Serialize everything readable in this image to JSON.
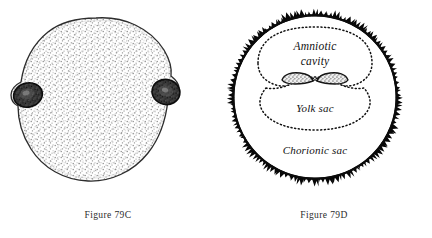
{
  "page": {
    "background_color": "#ffffff",
    "ink_color": "#111111",
    "width": 432,
    "height": 238
  },
  "figures": [
    {
      "id": "79C",
      "caption": "Figure 79C",
      "subject": "chorionic-vesicle-external-view",
      "description": "Stippled rounded chorionic vesicle with two dark villous patches at left and right margins",
      "labels": [],
      "features": [
        {
          "name": "stippled-surface",
          "shade": "#9a9a9a"
        },
        {
          "name": "villous-patch-left",
          "shade": "#2a2a2a"
        },
        {
          "name": "villous-patch-right",
          "shade": "#2a2a2a"
        }
      ]
    },
    {
      "id": "79D",
      "caption": "Figure 79D",
      "subject": "chorionic-sac-sagittal-section",
      "description": "Circular chorionic sac outlined by dark villi, containing amniotic cavity, embryonic disc and yolk sac",
      "labels": [
        {
          "name": "amniotic-cavity",
          "line1": "Amniotic",
          "line2": "cavity"
        },
        {
          "name": "yolk-sac",
          "text": "Yolk sac"
        },
        {
          "name": "chorionic-sac",
          "text": "Chorionic sac"
        }
      ],
      "features": [
        {
          "name": "chorionic-villi-border",
          "shade": "#0a0a0a"
        },
        {
          "name": "amnion-dotted-outline",
          "shade": "#111111"
        },
        {
          "name": "yolk-sac-dotted-outline",
          "shade": "#111111"
        },
        {
          "name": "embryonic-disc",
          "shade": "#555555"
        }
      ]
    }
  ]
}
